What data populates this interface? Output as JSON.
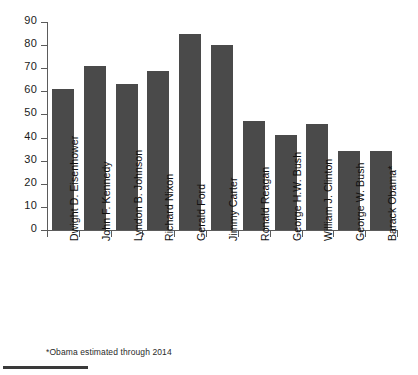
{
  "chart_data": {
    "type": "bar",
    "title": "",
    "subtitle": "",
    "xlabel": "",
    "ylabel": "",
    "ylim": [
      0,
      90
    ],
    "yticks": [
      0,
      10,
      20,
      30,
      40,
      50,
      60,
      70,
      80,
      90
    ],
    "grid": false,
    "legend": "none",
    "bar_color": "#4a4a4a",
    "axis_color": "#5b5b5b",
    "categories": [
      "Dwight D. Eisenhower",
      "John F. Kennedy",
      "Lyndon B. Johnson",
      "Richard Nixon",
      "Gerald Ford",
      "Jimmy Carter",
      "Ronald Reagan",
      "George H.W. Bush",
      "William J. Clinton",
      "George W. Bush",
      "Barack Obama*"
    ],
    "values": [
      61,
      71,
      63,
      69,
      85,
      80,
      47,
      41,
      46,
      34,
      34
    ],
    "annotations": [
      "*Obama estimated through 2014"
    ]
  },
  "footnote": {
    "text": "*Obama estimated through 2014"
  }
}
